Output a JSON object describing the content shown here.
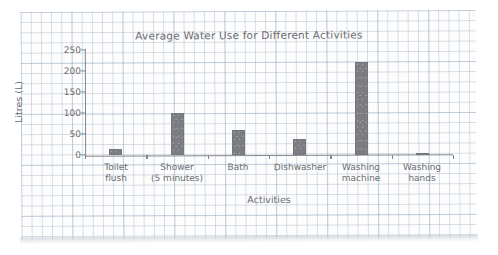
{
  "chart_data": {
    "type": "bar",
    "title": "Average Water Use for Different Activities",
    "xlabel": "Activities",
    "ylabel": "Litres (L)",
    "categories": [
      "Toilet\nflush",
      "Shower\n(5 minutes)",
      "Bath",
      "Dishwasher",
      "Washing\nmachine",
      "Washing\nhands"
    ],
    "values": [
      15,
      100,
      60,
      38,
      220,
      5
    ],
    "ylim": [
      0,
      250
    ],
    "yticks": [
      0,
      50,
      100,
      150,
      200,
      250
    ],
    "ytick_labels": [
      "0",
      "50",
      "100",
      "150",
      "200",
      "250"
    ],
    "grid": true,
    "legend": "none",
    "bar_color": "#7b7d82",
    "axis_color": "#83858a",
    "text_color": "#6a6c71",
    "paper": "graph-paper-grid",
    "grid_color": "#96aabe"
  }
}
